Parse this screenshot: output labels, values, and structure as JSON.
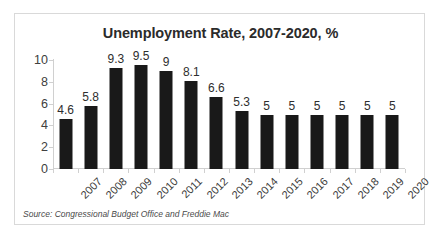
{
  "chart_data": {
    "type": "bar",
    "title": "Unemployment Rate, 2007-2020, %",
    "xlabel": "",
    "ylabel": "",
    "categories": [
      "2007",
      "2008",
      "2009",
      "2010",
      "2011",
      "2012",
      "2013",
      "2014",
      "2015",
      "2016",
      "2017",
      "2018",
      "2019",
      "2020"
    ],
    "values": [
      4.6,
      5.8,
      9.3,
      9.5,
      9,
      8.1,
      6.6,
      5.3,
      5,
      5,
      5,
      5,
      5,
      5
    ],
    "value_labels": [
      "4.6",
      "5.8",
      "9.3",
      "9.5",
      "9",
      "8.1",
      "6.6",
      "5.3",
      "5",
      "5",
      "5",
      "5",
      "5",
      "5"
    ],
    "ylim": [
      0,
      10
    ],
    "yticks": [
      0,
      2,
      4,
      6,
      8,
      10
    ],
    "ytick_labels": [
      "0",
      "2",
      "4",
      "6",
      "8",
      "10"
    ],
    "grid": false,
    "legend": false,
    "data_labels_shown": true,
    "bar_color": "#191919",
    "axis_color": "#d0d0d0",
    "title_color": "#2b2b2b"
  },
  "source": {
    "note": "Source: Congressional Budget Office and Freddie Mac"
  },
  "frame": {
    "border_color": "#d9d9d9",
    "background": "#ffffff"
  }
}
